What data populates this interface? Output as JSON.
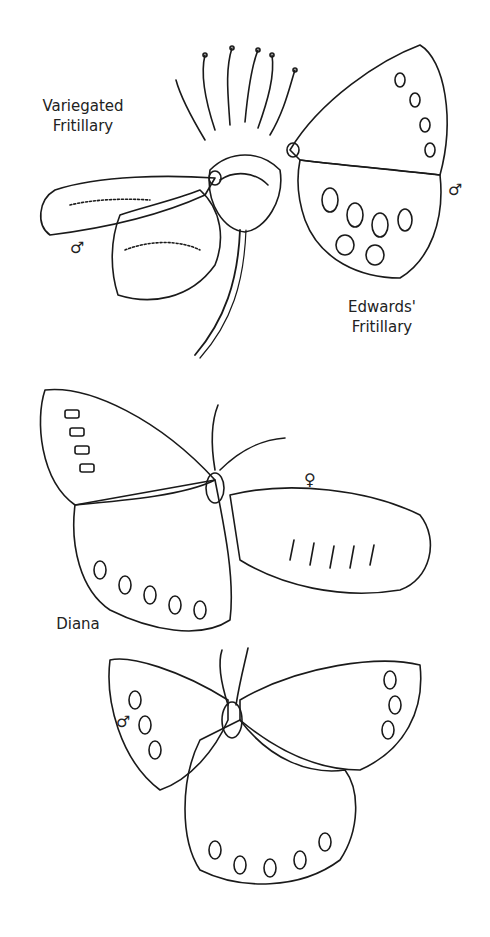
{
  "page": {
    "type": "coloring-page",
    "background": "#ffffff",
    "line_color": "#1a1a1a"
  },
  "labels": {
    "variegated": [
      "Variegated",
      "Fritillary"
    ],
    "edwards": [
      "Edwards'",
      "Fritillary"
    ],
    "diana": "Diana"
  },
  "symbols": {
    "male": "♂",
    "female": "♀"
  },
  "figures": [
    {
      "name": "Variegated Fritillary",
      "sex": "male"
    },
    {
      "name": "Edwards' Fritillary",
      "sex": "male"
    },
    {
      "name": "Diana",
      "sex": "female"
    },
    {
      "name": "Diana",
      "sex": "male"
    }
  ]
}
